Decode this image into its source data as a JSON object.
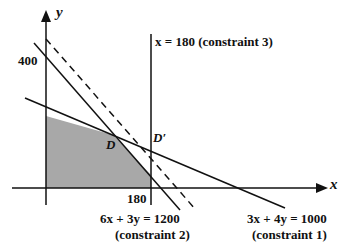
{
  "axes": {
    "x_label": "x",
    "y_label": "y",
    "y_tick": "400",
    "x_tick": "180"
  },
  "points": {
    "D": "D",
    "D_prime": "D′"
  },
  "constraints": {
    "c3": "x = 180 (constraint 3)",
    "c2_eq": "6x + 3y = 1200",
    "c2_name": "(constraint 2)",
    "c1_eq": "3x + 4y = 1000",
    "c1_name": "(constraint 1)"
  },
  "colors": {
    "shade": "#a8a8a8",
    "line": "#111111"
  }
}
